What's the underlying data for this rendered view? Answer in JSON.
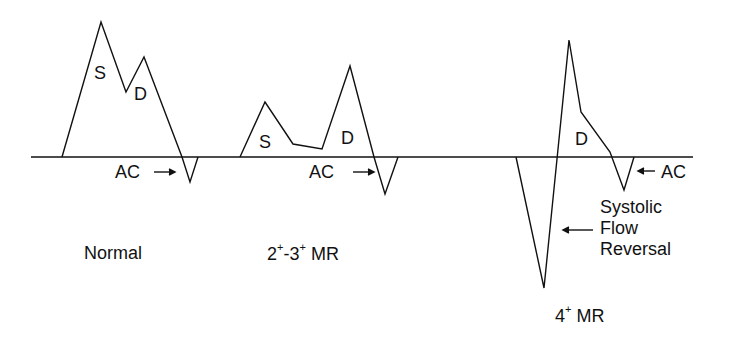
{
  "diagram": {
    "type": "pulmonary-venous-doppler-flow-patterns",
    "baseline": true,
    "colors": {
      "line": "#111111",
      "background": "#ffffff"
    },
    "panels": [
      {
        "id": "normal",
        "caption": "Normal",
        "waves": [
          {
            "label": "S",
            "description": "systolic forward flow (dominant)"
          },
          {
            "label": "D",
            "description": "diastolic forward flow"
          },
          {
            "label": "AC",
            "description": "atrial contraction reversal",
            "arrow": "→"
          }
        ]
      },
      {
        "id": "moderate-mr",
        "caption_base1": "2",
        "caption_sup1": "+",
        "caption_mid": "-3",
        "caption_sup2": "+",
        "caption_tail": " MR",
        "waves": [
          {
            "label": "S",
            "description": "blunted systolic flow"
          },
          {
            "label": "D",
            "description": "dominant diastolic flow"
          },
          {
            "label": "AC",
            "description": "atrial contraction reversal",
            "arrow": "→"
          }
        ]
      },
      {
        "id": "severe-mr",
        "caption_base": "4",
        "caption_sup": "+",
        "caption_tail": " MR",
        "waves": [
          {
            "label": "D",
            "description": "diastolic forward flow"
          },
          {
            "label": "AC",
            "description": "atrial contraction reversal",
            "arrow": "←"
          }
        ],
        "annotation": {
          "lines": [
            "Systolic",
            "Flow",
            "Reversal"
          ],
          "arrow": "←"
        }
      }
    ]
  }
}
